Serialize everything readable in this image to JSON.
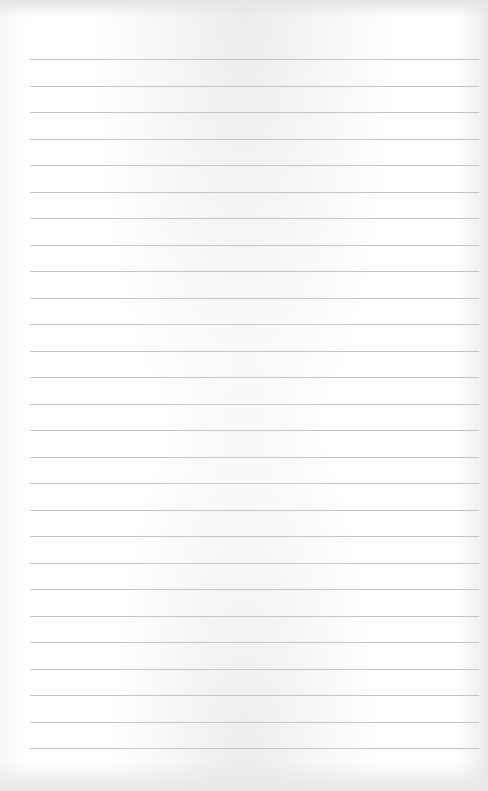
{
  "paper": {
    "type": "lined-paper",
    "line_count": 27,
    "first_line_y": 59,
    "line_spacing": 26.5,
    "line_left": 30,
    "line_right": 479,
    "line_color": "#c4c4c4",
    "background_color": "#ffffff"
  }
}
